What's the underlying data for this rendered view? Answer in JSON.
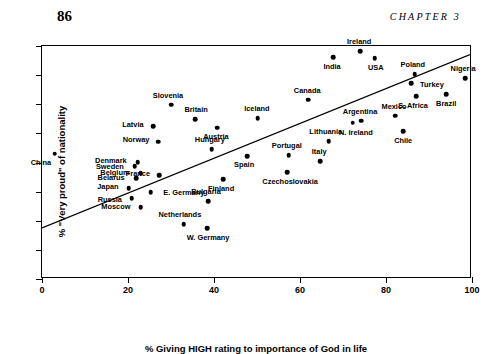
{
  "header": {
    "page_number": "86",
    "chapter_label": "CHAPTER 3"
  },
  "chart_data": {
    "type": "scatter",
    "title": "",
    "xlabel": "% Giving HIGH rating to importance of God in life",
    "ylabel": "% \"Very proud\" of nationality",
    "xlim": [
      0,
      100
    ],
    "ylim": [
      0,
      80
    ],
    "xticks": [
      0,
      20,
      40,
      60,
      80,
      100
    ],
    "yticks": [
      0,
      10,
      20,
      30,
      40,
      50,
      60,
      70,
      80
    ],
    "grid": false,
    "legend": null,
    "trendline": {
      "type": "line",
      "x": [
        0,
        100
      ],
      "y": [
        17,
        77
      ]
    },
    "points": [
      {
        "label": "China",
        "x": 3.0,
        "y": 43.0,
        "lx": -14,
        "ly": 9
      },
      {
        "label": "Denmark",
        "x": 22.3,
        "y": 40.2,
        "lx": -27,
        "ly": -1
      },
      {
        "label": "Sweden",
        "x": 21.6,
        "y": 38.8,
        "lx": -25,
        "ly": 1
      },
      {
        "label": "Belgium",
        "x": 23.0,
        "y": 36.4,
        "lx": -26,
        "ly": 0
      },
      {
        "label": "Belarus",
        "x": 21.9,
        "y": 34.7,
        "lx": -25,
        "ly": 0
      },
      {
        "label": "France",
        "x": 27.2,
        "y": 35.7,
        "lx": -21,
        "ly": -1
      },
      {
        "label": "Japan",
        "x": 20.2,
        "y": 31.2,
        "lx": -21,
        "ly": -1
      },
      {
        "label": "E. Germany",
        "x": 25.3,
        "y": 29.9,
        "lx": 33,
        "ly": 1
      },
      {
        "label": "Russia",
        "x": 20.9,
        "y": 27.8,
        "lx": -22,
        "ly": 2
      },
      {
        "label": "Moscow",
        "x": 23.0,
        "y": 24.7,
        "lx": -25,
        "ly": 0
      },
      {
        "label": "Latvia",
        "x": 25.8,
        "y": 52.5,
        "lx": -20,
        "ly": -1
      },
      {
        "label": "Norway",
        "x": 27.0,
        "y": 47.1,
        "lx": -22,
        "ly": -2
      },
      {
        "label": "Slovenia",
        "x": 30.0,
        "y": 59.8,
        "lx": -3,
        "ly": -9
      },
      {
        "label": "Britain",
        "x": 35.6,
        "y": 54.9,
        "lx": 1,
        "ly": -9
      },
      {
        "label": "Netherlands",
        "x": 33.0,
        "y": 18.9,
        "lx": -4,
        "ly": -9
      },
      {
        "label": "W. Germany",
        "x": 38.4,
        "y": 17.5,
        "lx": 1,
        "ly": 10
      },
      {
        "label": "Bulgaria",
        "x": 38.6,
        "y": 26.8,
        "lx": -2,
        "ly": -9
      },
      {
        "label": "Hungary",
        "x": 39.5,
        "y": 44.6,
        "lx": -2,
        "ly": -9
      },
      {
        "label": "Austria",
        "x": 40.7,
        "y": 51.9,
        "lx": -1,
        "ly": 9
      },
      {
        "label": "Finland",
        "x": 42.1,
        "y": 34.3,
        "lx": -2,
        "ly": 10
      },
      {
        "label": "Spain",
        "x": 47.7,
        "y": 42.2,
        "lx": -3,
        "ly": 9
      },
      {
        "label": "Iceland",
        "x": 50.2,
        "y": 55.3,
        "lx": -1,
        "ly": -9
      },
      {
        "label": "Czechoslovakia",
        "x": 57.0,
        "y": 36.7,
        "lx": 3,
        "ly": 10
      },
      {
        "label": "Portugal",
        "x": 57.4,
        "y": 42.6,
        "lx": -2,
        "ly": -9
      },
      {
        "label": "Canada",
        "x": 61.9,
        "y": 61.5,
        "lx": -1,
        "ly": -9
      },
      {
        "label": "Italy",
        "x": 64.7,
        "y": 40.5,
        "lx": -1,
        "ly": -9
      },
      {
        "label": "Lithuania",
        "x": 66.7,
        "y": 47.4,
        "lx": -3,
        "ly": -9
      },
      {
        "label": "India",
        "x": 67.7,
        "y": 76.2,
        "lx": -1,
        "ly": 10
      },
      {
        "label": "N. Ireland",
        "x": 72.3,
        "y": 53.6,
        "lx": 3,
        "ly": 10
      },
      {
        "label": "Ireland",
        "x": 74.0,
        "y": 78.3,
        "lx": -1,
        "ly": -9
      },
      {
        "label": "Argentina",
        "x": 74.2,
        "y": 54.3,
        "lx": -1,
        "ly": -9
      },
      {
        "label": "USA",
        "x": 77.4,
        "y": 75.9,
        "lx": 1,
        "ly": 10
      },
      {
        "label": "Mexico",
        "x": 82.1,
        "y": 56.0,
        "lx": -1,
        "ly": -9
      },
      {
        "label": "Chile",
        "x": 84.0,
        "y": 50.8,
        "lx": 0,
        "ly": 10
      },
      {
        "label": "Turkey",
        "x": 85.8,
        "y": 67.3,
        "lx": 21,
        "ly": 2
      },
      {
        "label": "Poland",
        "x": 86.7,
        "y": 70.4,
        "lx": -2,
        "ly": -9
      },
      {
        "label": "S. Africa",
        "x": 87.0,
        "y": 62.8,
        "lx": -3,
        "ly": 10
      },
      {
        "label": "Brazil",
        "x": 94.0,
        "y": 63.5,
        "lx": 0,
        "ly": 10
      },
      {
        "label": "Nigeria",
        "x": 98.4,
        "y": 69.0,
        "lx": -2,
        "ly": -9
      }
    ]
  }
}
